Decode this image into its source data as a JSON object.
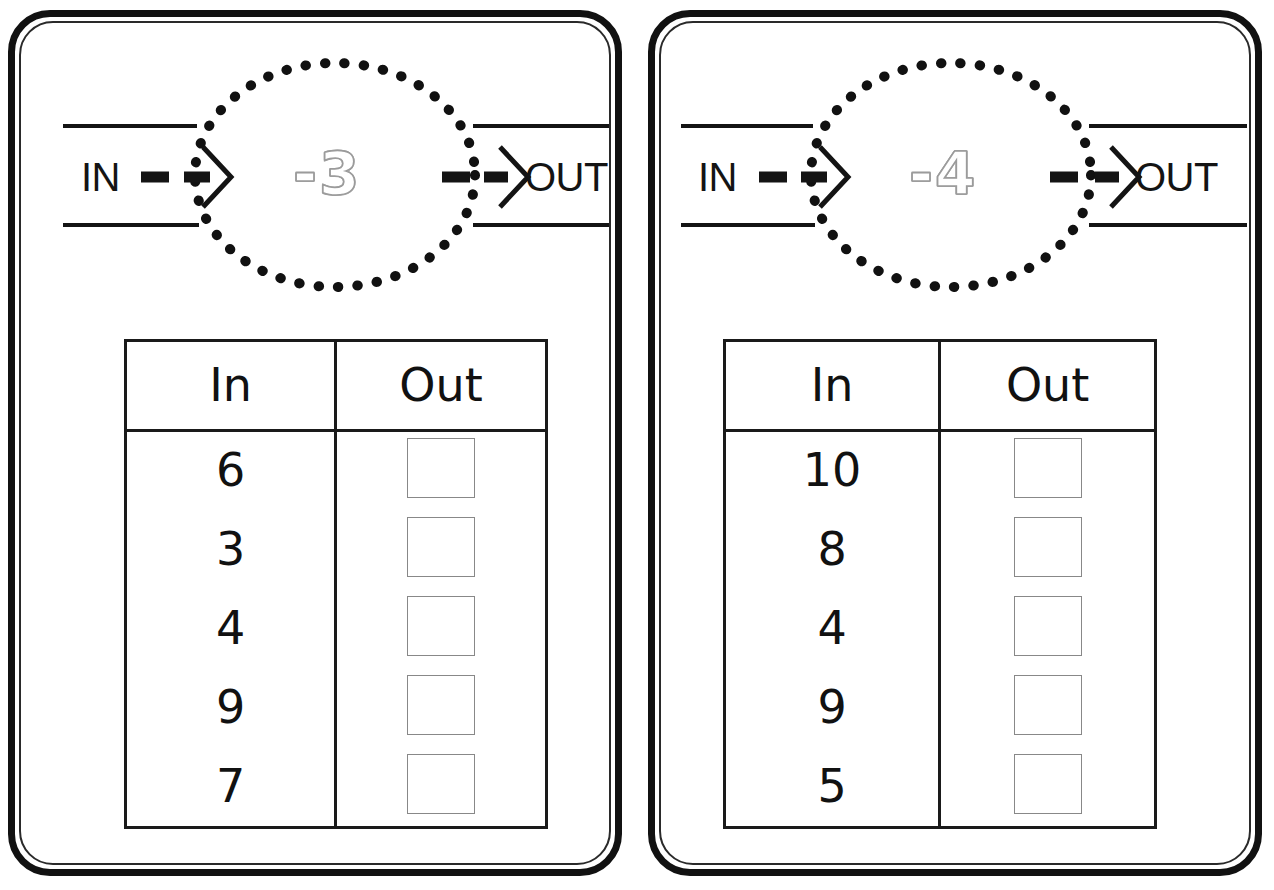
{
  "worksheet": {
    "type": "function-machine-worksheet",
    "card_count": 2,
    "ink_color": "#111111",
    "rule_color": "#9b9b9b",
    "answer_box_color": "#888888"
  },
  "cards": [
    {
      "id": "card-1",
      "machine": {
        "in_label": "IN",
        "out_label": "OUT",
        "rule": "-3",
        "operation": "subtract",
        "operand": 3
      },
      "table": {
        "headers": [
          "In",
          "Out"
        ],
        "rows": [
          {
            "in": "6",
            "out": ""
          },
          {
            "in": "3",
            "out": ""
          },
          {
            "in": "4",
            "out": ""
          },
          {
            "in": "9",
            "out": ""
          },
          {
            "in": "7",
            "out": ""
          }
        ]
      }
    },
    {
      "id": "card-2",
      "machine": {
        "in_label": "IN",
        "out_label": "OUT",
        "rule": "-4",
        "operation": "subtract",
        "operand": 4
      },
      "table": {
        "headers": [
          "In",
          "Out"
        ],
        "rows": [
          {
            "in": "10",
            "out": ""
          },
          {
            "in": "8",
            "out": ""
          },
          {
            "in": "4",
            "out": ""
          },
          {
            "in": "9",
            "out": ""
          },
          {
            "in": "5",
            "out": ""
          }
        ]
      }
    }
  ]
}
